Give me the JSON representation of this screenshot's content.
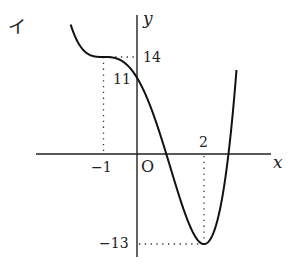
{
  "figure_label": "イ",
  "axes": {
    "x_label": "x",
    "y_label": "y",
    "origin_label": "O"
  },
  "ticks": {
    "x": [
      "−1",
      "2"
    ],
    "y": [
      "14",
      "11",
      "−13"
    ]
  },
  "colors": {
    "curve": "#111111",
    "axis": "#222222",
    "guide": "#333333"
  },
  "chart_data": {
    "type": "line",
    "title": "イ",
    "xlabel": "x",
    "ylabel": "y",
    "function": "y = x^4 - 6x^2 - 8x + 11",
    "key_points": [
      {
        "x": -1,
        "y": 14,
        "note": "stationary inflection (horizontal tangent)"
      },
      {
        "x": 0,
        "y": 11,
        "note": "y-intercept"
      },
      {
        "x": 2,
        "y": -13,
        "note": "local minimum"
      }
    ],
    "x_ticks": [
      -1,
      2
    ],
    "y_ticks": [
      14,
      11,
      -13
    ],
    "xlim": [
      -3,
      4
    ],
    "ylim": [
      -15,
      20
    ],
    "grid": false,
    "guides": "dotted lines from (-1,14) and (2,-13) to the axes"
  }
}
